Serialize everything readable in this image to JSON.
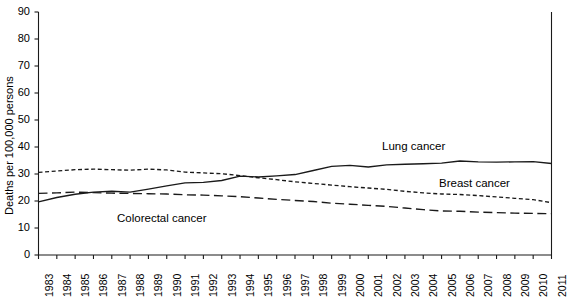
{
  "chart_data": {
    "type": "line",
    "title": "",
    "xlabel": "",
    "ylabel": "Deaths per 100,000 persons",
    "ylim": [
      0,
      90
    ],
    "ytick_step": 10,
    "yticks": [
      "0",
      "10",
      "20",
      "30",
      "40",
      "50",
      "60",
      "70",
      "80",
      "90"
    ],
    "grid": false,
    "legend_position": "inline-annotations",
    "x": [
      "1983",
      "1984",
      "1985",
      "1986",
      "1987",
      "1988",
      "1989",
      "1990",
      "1991",
      "1992",
      "1993",
      "1994",
      "1995",
      "1996",
      "1997",
      "1998",
      "1999",
      "2000",
      "2001",
      "2002",
      "2003",
      "2004",
      "2005",
      "2006",
      "2007",
      "2008",
      "2009",
      "2010",
      "2011"
    ],
    "series": [
      {
        "name": "Lung cancer",
        "style": "solid",
        "color": "#1a1a1a",
        "values": [
          19.7,
          21.3,
          22.5,
          23.3,
          23.6,
          23.3,
          24.4,
          25.6,
          26.7,
          26.9,
          27.6,
          29.2,
          28.9,
          29.3,
          29.8,
          31.3,
          32.8,
          33.2,
          32.6,
          33.4,
          33.6,
          33.8,
          34.0,
          34.8,
          34.5,
          34.4,
          34.5,
          34.6,
          33.9
        ]
      },
      {
        "name": "Breast cancer",
        "style": "dotted",
        "color": "#1a1a1a",
        "values": [
          30.6,
          31.1,
          31.6,
          31.8,
          31.6,
          31.4,
          31.8,
          31.5,
          30.7,
          30.4,
          30.1,
          29.4,
          28.6,
          27.9,
          27.1,
          26.5,
          25.9,
          25.3,
          24.8,
          24.3,
          23.6,
          23.0,
          22.6,
          22.4,
          22.0,
          21.5,
          21.0,
          20.5,
          19.4
        ]
      },
      {
        "name": "Colorectal cancer",
        "style": "dashed",
        "color": "#1a1a1a",
        "values": [
          22.8,
          23.0,
          23.3,
          23.1,
          22.9,
          22.8,
          22.7,
          22.6,
          22.3,
          22.2,
          21.9,
          21.6,
          21.1,
          20.6,
          20.2,
          19.8,
          19.2,
          18.8,
          18.4,
          18.0,
          17.4,
          16.8,
          16.3,
          16.2,
          15.9,
          15.7,
          15.5,
          15.4,
          15.3
        ]
      }
    ],
    "annotations": [
      {
        "text": "Lung cancer",
        "x_px": 382,
        "y_px": 140
      },
      {
        "text": "Breast cancer",
        "x_px": 439,
        "y_px": 177
      },
      {
        "text": "Colorectal cancer",
        "x_px": 117,
        "y_px": 212
      }
    ]
  }
}
